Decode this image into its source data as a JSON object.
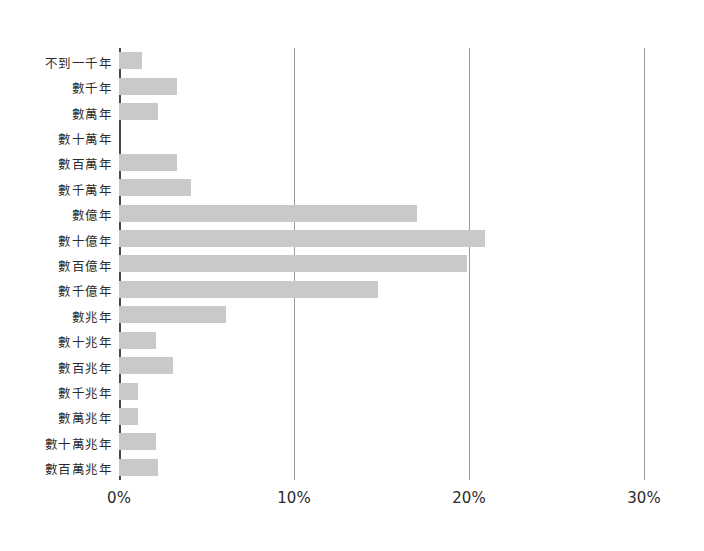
{
  "chart_data": {
    "type": "bar",
    "orientation": "horizontal",
    "title": "",
    "xlabel": "",
    "ylabel": "",
    "xlim": [
      0,
      30
    ],
    "xticks": [
      0,
      10,
      20,
      30
    ],
    "xtick_labels": [
      "0%",
      "10%",
      "20%",
      "30%"
    ],
    "grid": "vertical",
    "legend": "none",
    "bar_color": "#c9c9c9",
    "axis_color": "#4a4a4a",
    "gridline_color": "#9a9a9a",
    "value_unit": "%",
    "categories": [
      "不到一千年",
      "數千年",
      "數萬年",
      "數十萬年",
      "數百萬年",
      "數千萬年",
      "數億年",
      "數十億年",
      "數百億年",
      "數千億年",
      "數兆年",
      "數十兆年",
      "數百兆年",
      "數千兆年",
      "數萬兆年",
      "數十萬兆年",
      "數百萬兆年"
    ],
    "values": [
      1.3,
      3.3,
      2.2,
      0.0,
      3.3,
      4.1,
      17.0,
      20.9,
      19.9,
      14.8,
      6.1,
      2.1,
      3.1,
      1.1,
      1.1,
      2.1,
      2.2
    ]
  }
}
